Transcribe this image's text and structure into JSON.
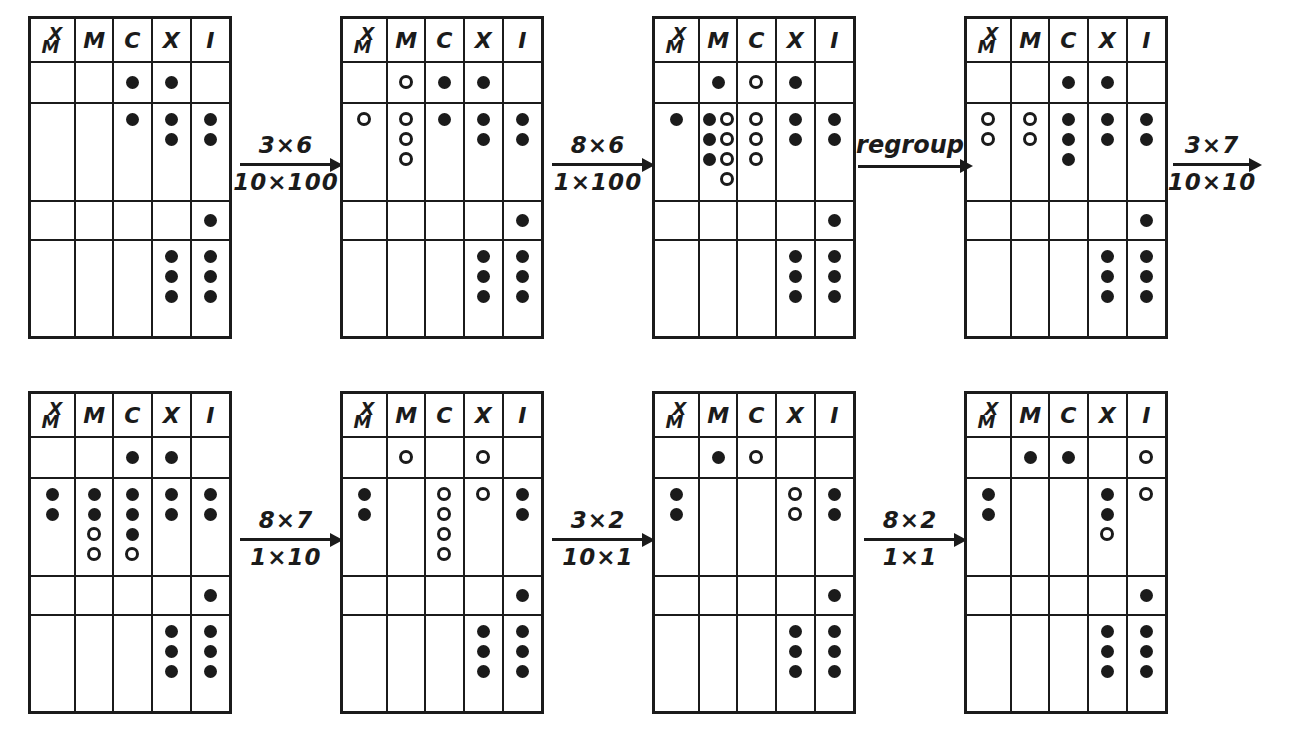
{
  "colors": {
    "ink": "#1b1b1b",
    "paper": "#ffffff"
  },
  "columns": [
    {
      "key": "XM",
      "label": "XM",
      "stacked": true,
      "line1": "X",
      "line2": "M"
    },
    {
      "key": "M",
      "label": "M"
    },
    {
      "key": "C",
      "label": "C"
    },
    {
      "key": "X",
      "label": "X"
    },
    {
      "key": "I",
      "label": "I"
    }
  ],
  "arrows": [
    {
      "top": "3×6",
      "bottom": "10×100"
    },
    {
      "top": "8×6",
      "bottom": "1×100"
    },
    {
      "top": "regroup",
      "bottom": ""
    },
    {
      "top": "3×7",
      "bottom": "10×10"
    },
    {
      "top": "8×7",
      "bottom": "1×10"
    },
    {
      "top": "3×2",
      "bottom": "10×1"
    },
    {
      "top": "8×2",
      "bottom": "1×1"
    }
  ],
  "boards": [
    {
      "rows": [
        {
          "size": "short",
          "cells": [
            [],
            [],
            [
              "f"
            ],
            [
              "f"
            ],
            []
          ]
        },
        {
          "size": "tall",
          "cells": [
            [],
            [],
            [
              "f"
            ],
            [
              "ff"
            ],
            [
              "ff"
            ]
          ]
        },
        {
          "size": "short",
          "cells": [
            [],
            [],
            [],
            [],
            [
              "f"
            ]
          ]
        },
        {
          "size": "tall",
          "cells": [
            [],
            [],
            [],
            [
              "fff"
            ],
            [
              "fff"
            ]
          ]
        }
      ]
    },
    {
      "rows": [
        {
          "size": "short",
          "cells": [
            [],
            [
              "o"
            ],
            [
              "f"
            ],
            [
              "f"
            ],
            []
          ]
        },
        {
          "size": "tall",
          "cells": [
            [
              "o"
            ],
            [
              "ooo"
            ],
            [
              "f"
            ],
            [
              "ff"
            ],
            [
              "ff"
            ]
          ]
        },
        {
          "size": "short",
          "cells": [
            [],
            [],
            [],
            [],
            [
              "f"
            ]
          ]
        },
        {
          "size": "tall",
          "cells": [
            [],
            [],
            [],
            [
              "fff"
            ],
            [
              "fff"
            ]
          ]
        }
      ]
    },
    {
      "rows": [
        {
          "size": "short",
          "cells": [
            [],
            [
              "f"
            ],
            [
              "o"
            ],
            [
              "f"
            ],
            []
          ]
        },
        {
          "size": "tall",
          "cells": [
            [
              "f"
            ],
            [
              "fff",
              "oooo"
            ],
            [
              "ooo"
            ],
            [
              "ff"
            ],
            [
              "ff"
            ]
          ]
        },
        {
          "size": "short",
          "cells": [
            [],
            [],
            [],
            [],
            [
              "f"
            ]
          ]
        },
        {
          "size": "tall",
          "cells": [
            [],
            [],
            [],
            [
              "fff"
            ],
            [
              "fff"
            ]
          ]
        }
      ]
    },
    {
      "rows": [
        {
          "size": "short",
          "cells": [
            [],
            [],
            [
              "f"
            ],
            [
              "f"
            ],
            []
          ]
        },
        {
          "size": "tall",
          "cells": [
            [
              "oo"
            ],
            [
              "oo"
            ],
            [
              "fff"
            ],
            [
              "ff"
            ],
            [
              "ff"
            ]
          ]
        },
        {
          "size": "short",
          "cells": [
            [],
            [],
            [],
            [],
            [
              "f"
            ]
          ]
        },
        {
          "size": "tall",
          "cells": [
            [],
            [],
            [],
            [
              "fff"
            ],
            [
              "fff"
            ]
          ]
        }
      ]
    },
    {
      "rows": [
        {
          "size": "short",
          "cells": [
            [],
            [],
            [
              "f"
            ],
            [
              "f"
            ],
            []
          ]
        },
        {
          "size": "tall",
          "cells": [
            [
              "ff"
            ],
            [
              "ffoo"
            ],
            [
              "fffo"
            ],
            [
              "ff"
            ],
            [
              "ff"
            ]
          ]
        },
        {
          "size": "short",
          "cells": [
            [],
            [],
            [],
            [],
            [
              "f"
            ]
          ]
        },
        {
          "size": "tall",
          "cells": [
            [],
            [],
            [],
            [
              "fff"
            ],
            [
              "fff"
            ]
          ]
        }
      ]
    },
    {
      "rows": [
        {
          "size": "short",
          "cells": [
            [],
            [
              "o"
            ],
            [],
            [
              "o"
            ],
            []
          ]
        },
        {
          "size": "tall",
          "cells": [
            [
              "ff"
            ],
            [],
            [
              "oooo"
            ],
            [
              "o"
            ],
            [
              "ff"
            ]
          ]
        },
        {
          "size": "short",
          "cells": [
            [],
            [],
            [],
            [],
            [
              "f"
            ]
          ]
        },
        {
          "size": "tall",
          "cells": [
            [],
            [],
            [],
            [
              "fff"
            ],
            [
              "fff"
            ]
          ]
        }
      ]
    },
    {
      "rows": [
        {
          "size": "short",
          "cells": [
            [],
            [
              "f"
            ],
            [
              "o"
            ],
            [],
            []
          ]
        },
        {
          "size": "tall",
          "cells": [
            [
              "ff"
            ],
            [],
            [],
            [
              "oo"
            ],
            [
              "ff"
            ]
          ]
        },
        {
          "size": "short",
          "cells": [
            [],
            [],
            [],
            [],
            [
              "f"
            ]
          ]
        },
        {
          "size": "tall",
          "cells": [
            [],
            [],
            [],
            [
              "fff"
            ],
            [
              "fff"
            ]
          ]
        }
      ]
    },
    {
      "rows": [
        {
          "size": "short",
          "cells": [
            [],
            [
              "f"
            ],
            [
              "f"
            ],
            [],
            [
              "o"
            ]
          ]
        },
        {
          "size": "tall",
          "cells": [
            [
              "ff"
            ],
            [],
            [],
            [
              "ffo"
            ],
            [
              "o"
            ]
          ]
        },
        {
          "size": "short",
          "cells": [
            [],
            [],
            [],
            [],
            [
              "f"
            ]
          ]
        },
        {
          "size": "tall",
          "cells": [
            [],
            [],
            [],
            [
              "fff"
            ],
            [
              "fff"
            ]
          ]
        }
      ]
    }
  ]
}
